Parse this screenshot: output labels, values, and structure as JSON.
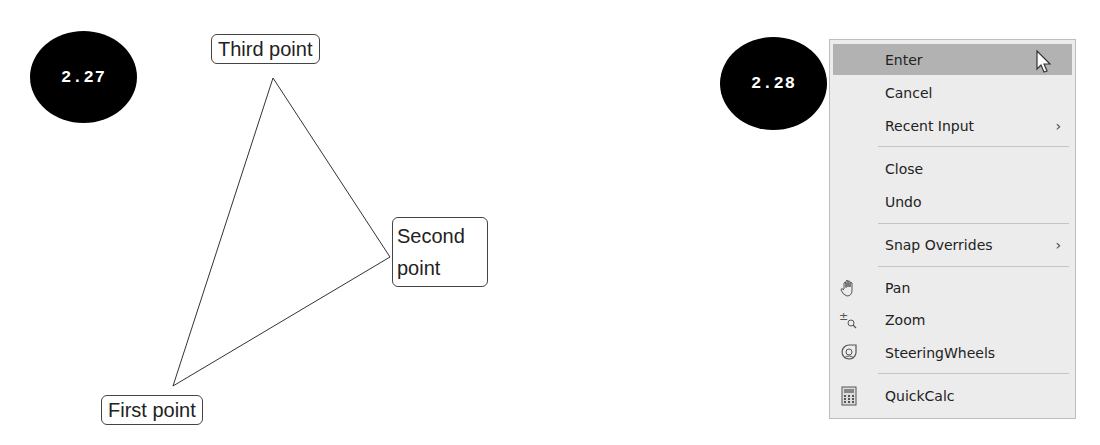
{
  "figures": [
    {
      "number": "2.27",
      "points": [
        {
          "label": "Third point",
          "x": 273,
          "y": 78
        },
        {
          "label": "Second point",
          "x": 390,
          "y": 257
        },
        {
          "label": "First point",
          "x": 173,
          "y": 386
        }
      ],
      "labels": {
        "third": "Third point",
        "second_line1": "Second",
        "second_line2": "point",
        "first": "First point"
      }
    },
    {
      "number": "2.28",
      "menu": {
        "items": [
          {
            "label": "Enter",
            "highlighted": true
          },
          {
            "label": "Cancel"
          },
          {
            "label": "Recent Input",
            "submenu": true,
            "arrow": "›"
          },
          {
            "label": "Close"
          },
          {
            "label": "Undo"
          },
          {
            "label": "Snap Overrides",
            "submenu": true,
            "arrow": "›"
          },
          {
            "label": "Pan",
            "icon": "pan-hand-icon"
          },
          {
            "label": "Zoom",
            "icon": "zoom-icon"
          },
          {
            "label": "SteeringWheels",
            "icon": "steering-wheels-icon"
          },
          {
            "label": "QuickCalc",
            "icon": "calculator-icon"
          }
        ]
      }
    }
  ]
}
